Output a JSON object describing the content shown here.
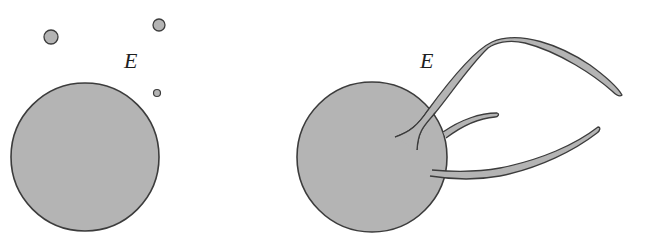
{
  "figure": {
    "type": "diagram",
    "colors": {
      "fill": "#b4b4b4",
      "stroke": "#3c3c3c",
      "background": "#ffffff",
      "label": "#1e1e1e"
    }
  },
  "panels": [
    {
      "id": "left",
      "label": "E",
      "large_circle": {
        "cx": 85,
        "cy": 157,
        "r": 74
      },
      "small_circles": [
        {
          "cx": 51,
          "cy": 37,
          "r": 7
        },
        {
          "cx": 159,
          "cy": 25,
          "r": 6
        },
        {
          "cx": 157,
          "cy": 93,
          "r": 3.5
        }
      ]
    },
    {
      "id": "right",
      "label": "E",
      "large_circle": {
        "cx": 372,
        "cy": 157,
        "r": 75
      },
      "filaments": [
        {
          "name": "long-upper-filament",
          "count": 1
        },
        {
          "name": "short-middle-filament",
          "count": 1
        },
        {
          "name": "lower-filament",
          "count": 1
        }
      ]
    }
  ]
}
